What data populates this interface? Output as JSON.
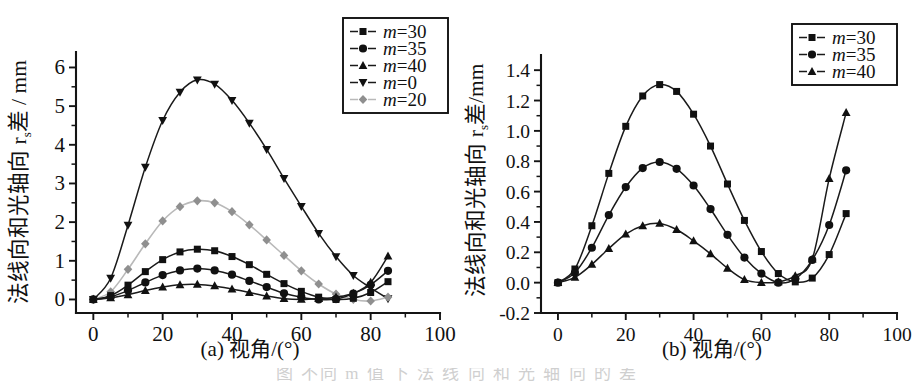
{
  "figure": {
    "panel_a_caption": "(a) 视角/(°)",
    "panel_b_caption": "(b) 视角/(°)",
    "bottom_caption_fragment": "图   不同 m 值 下 法 线 向 和 光 轴 向 的 差"
  },
  "panel_a": {
    "ylabel": "法线向和光轴向 r",
    "ylabel_sub": "s",
    "ylabel_tail": "差 / mm",
    "xlabel": "视角/(°)",
    "x_ticks": [
      "0",
      "20",
      "40",
      "60",
      "80",
      "100"
    ],
    "y_ticks": [
      "0",
      "1",
      "2",
      "3",
      "4",
      "5",
      "6"
    ],
    "legend": [
      {
        "label": "m=30",
        "marker": "square",
        "color": "#111111"
      },
      {
        "label": "m=35",
        "marker": "circle",
        "color": "#111111"
      },
      {
        "label": "m=40",
        "marker": "triangle-up",
        "color": "#111111"
      },
      {
        "label": "m=0",
        "marker": "triangle-down",
        "color": "#111111"
      },
      {
        "label": "m=20",
        "marker": "diamond",
        "color": "#8f8f8f"
      }
    ]
  },
  "panel_b": {
    "ylabel": "法线向和光轴向 r",
    "ylabel_sub": "s",
    "ylabel_tail": "差/mm",
    "xlabel": "视角/(°)",
    "x_ticks": [
      "0",
      "20",
      "40",
      "60",
      "80",
      "100"
    ],
    "y_ticks": [
      "-0.2",
      "0.0",
      "0.2",
      "0.4",
      "0.6",
      "0.8",
      "1.0",
      "1.2",
      "1.4"
    ],
    "legend": [
      {
        "label": "m=30",
        "marker": "square",
        "color": "#111111"
      },
      {
        "label": "m=35",
        "marker": "circle",
        "color": "#111111"
      },
      {
        "label": "m=40",
        "marker": "triangle-up",
        "color": "#111111"
      }
    ]
  },
  "chart_data": [
    {
      "type": "line",
      "panel": "a",
      "title": "(a) 视角/(°)",
      "xlabel": "视角/(°)",
      "ylabel": "法线向和光轴向 rs 差 / mm",
      "xlim": [
        -5,
        100
      ],
      "ylim": [
        -0.35,
        6.4
      ],
      "xticks": [
        0,
        20,
        40,
        60,
        80,
        100
      ],
      "yticks": [
        0,
        1,
        2,
        3,
        4,
        5,
        6
      ],
      "grid": false,
      "legend_position": "top-right",
      "x": [
        0,
        5,
        10,
        15,
        20,
        25,
        30,
        35,
        40,
        45,
        50,
        55,
        60,
        65,
        70,
        75,
        80,
        85
      ],
      "series": [
        {
          "name": "m=0",
          "marker": "triangle-down",
          "color": "#111111",
          "values": [
            0.0,
            0.55,
            1.92,
            3.42,
            4.63,
            5.36,
            5.68,
            5.57,
            5.15,
            4.56,
            3.88,
            3.13,
            2.41,
            1.71,
            1.11,
            0.62,
            0.3,
            0.02
          ]
        },
        {
          "name": "m=20",
          "marker": "diamond",
          "color": "#8f8f8f",
          "values": [
            0.0,
            0.2,
            0.78,
            1.44,
            2.03,
            2.4,
            2.55,
            2.5,
            2.27,
            1.93,
            1.54,
            1.14,
            0.74,
            0.4,
            0.14,
            0.0,
            -0.04,
            0.06
          ]
        },
        {
          "name": "m=30",
          "marker": "square",
          "color": "#111111",
          "values": [
            0.0,
            0.1,
            0.37,
            0.72,
            1.03,
            1.23,
            1.3,
            1.26,
            1.11,
            0.9,
            0.65,
            0.41,
            0.21,
            0.06,
            0.0,
            0.03,
            0.18,
            0.46
          ]
        },
        {
          "name": "m=35",
          "marker": "circle",
          "color": "#111111",
          "values": [
            0.0,
            0.07,
            0.23,
            0.44,
            0.63,
            0.75,
            0.8,
            0.75,
            0.64,
            0.48,
            0.32,
            0.16,
            0.06,
            0.0,
            0.01,
            0.15,
            0.38,
            0.74
          ]
        },
        {
          "name": "m=40",
          "marker": "triangle-up",
          "color": "#111111",
          "values": [
            0.0,
            0.04,
            0.12,
            0.23,
            0.32,
            0.38,
            0.39,
            0.35,
            0.27,
            0.18,
            0.09,
            0.02,
            0.0,
            0.02,
            0.06,
            0.16,
            0.44,
            1.12
          ]
        }
      ]
    },
    {
      "type": "line",
      "panel": "b",
      "title": "(b) 视角/(°)",
      "xlabel": "视角/(°)",
      "ylabel": "法线向和光轴向 rs 差/mm",
      "xlim": [
        -5,
        100
      ],
      "ylim": [
        -0.2,
        1.5
      ],
      "xticks": [
        0,
        20,
        40,
        60,
        80,
        100
      ],
      "yticks": [
        -0.2,
        0.0,
        0.2,
        0.4,
        0.6,
        0.8,
        1.0,
        1.2,
        1.4
      ],
      "grid": false,
      "legend_position": "top-right",
      "x": [
        0,
        5,
        10,
        15,
        20,
        25,
        30,
        35,
        40,
        45,
        50,
        55,
        60,
        65,
        70,
        75,
        80,
        85
      ],
      "series": [
        {
          "name": "m=30",
          "marker": "square",
          "color": "#111111",
          "values": [
            0.0,
            0.09,
            0.375,
            0.72,
            1.03,
            1.23,
            1.305,
            1.26,
            1.11,
            0.9,
            0.65,
            0.41,
            0.205,
            0.06,
            0.005,
            0.03,
            0.185,
            0.455
          ]
        },
        {
          "name": "m=35",
          "marker": "circle",
          "color": "#111111",
          "values": [
            0.0,
            0.065,
            0.23,
            0.445,
            0.63,
            0.755,
            0.795,
            0.75,
            0.64,
            0.485,
            0.315,
            0.165,
            0.06,
            0.0,
            0.025,
            0.15,
            0.38,
            0.74
          ]
        },
        {
          "name": "m=40",
          "marker": "triangle-up",
          "color": "#111111",
          "values": [
            0.0,
            0.035,
            0.12,
            0.225,
            0.32,
            0.375,
            0.39,
            0.35,
            0.275,
            0.19,
            0.095,
            0.02,
            0.0,
            0.005,
            0.045,
            0.155,
            0.685,
            1.12
          ]
        }
      ]
    }
  ]
}
